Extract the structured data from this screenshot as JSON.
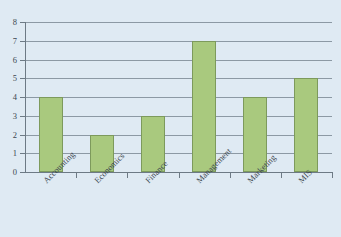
{
  "chart_data": {
    "type": "bar",
    "title": "",
    "subtitle": "",
    "xlabel": "",
    "ylabel": "",
    "categories": [
      "Accounting",
      "Economics",
      "Finance",
      "Management",
      "Marketing",
      "MIS"
    ],
    "values": [
      4,
      2,
      3,
      7,
      4,
      5
    ],
    "ylim": [
      0,
      8
    ],
    "ytick_labels": [
      "0",
      "1",
      "2",
      "3",
      "4",
      "5",
      "6",
      "7",
      "8"
    ],
    "ytick_values": [
      0,
      1,
      2,
      3,
      4,
      5,
      6,
      7,
      8
    ],
    "grid": true,
    "grid_axis": "y",
    "legend": false,
    "legend_position": "none",
    "series": [
      {
        "name": "Count",
        "values": [
          4,
          2,
          3,
          7,
          4,
          5
        ]
      }
    ],
    "colors": {
      "background": "#dfeaf3",
      "bar_fill": "#a9c97e",
      "bar_border": "#7d9a5c",
      "gridline": "#8c99a4",
      "axis": "#6d7a85",
      "text": "#3b4750"
    },
    "xtick_label_rotation": -45
  }
}
